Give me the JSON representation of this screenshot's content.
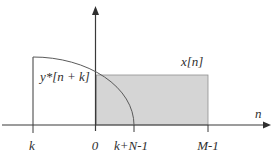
{
  "figure": {
    "curve_label": "y*[n + k]",
    "rect_label": "x[n]",
    "axis_label": "n",
    "ticks": [
      "k",
      "0",
      "k+N-1",
      "M-1"
    ]
  },
  "colors": {
    "background": "#ffffff",
    "shade_fill": "#d5d5d5",
    "shade_border": "#8f8f8f",
    "axis_line": "#3a3a3a",
    "curve_line": "#5a5a5a"
  }
}
